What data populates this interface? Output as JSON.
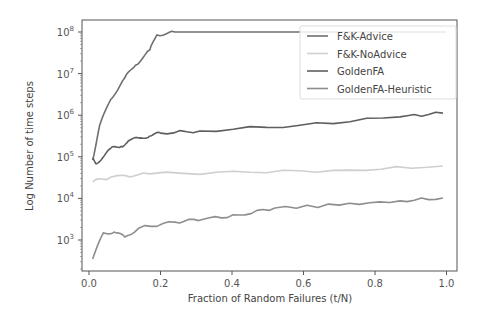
{
  "chart_data": {
    "type": "line",
    "title": "",
    "xlabel": "Fraction of Random Failures (t/N)",
    "ylabel": "Log Number of time steps",
    "xlim": [
      -0.01,
      1.03
    ],
    "ylim_log10": [
      2.3,
      8.3
    ],
    "yscale": "log",
    "x_ticks": [
      0.0,
      0.2,
      0.4,
      0.6,
      0.8,
      1.0
    ],
    "x_tick_labels": [
      "0.0",
      "0.2",
      "0.4",
      "0.6",
      "0.8",
      "1.0"
    ],
    "y_ticks_log10": [
      3,
      4,
      5,
      6,
      7,
      8
    ],
    "y_tick_labels": [
      "10^3",
      "10^4",
      "10^5",
      "10^6",
      "10^7",
      "10^8"
    ],
    "grid": false,
    "legend_position": "upper right",
    "series": [
      {
        "name": "F&K-Advice",
        "color": "#6f6f6f",
        "x": [
          0.01,
          0.03,
          0.06,
          0.1,
          0.13,
          0.17,
          0.19,
          0.24,
          0.4,
          0.6,
          0.8,
          1.0
        ],
        "log10_y": [
          4.92,
          5.76,
          6.37,
          6.9,
          7.2,
          7.57,
          7.93,
          8.0,
          8.0,
          8.0,
          8.0,
          8.0
        ]
      },
      {
        "name": "F&K-NoAdvice",
        "color": "#cfcfcf",
        "x": [
          0.01,
          0.06,
          0.17,
          0.45,
          0.73,
          0.99
        ],
        "log10_y": [
          4.4,
          4.51,
          4.59,
          4.63,
          4.68,
          4.78
        ]
      },
      {
        "name": "GoldenFA",
        "color": "#5e5e5e",
        "x": [
          0.01,
          0.02,
          0.06,
          0.09,
          0.11,
          0.14,
          0.17,
          0.2,
          0.31,
          0.59,
          0.87,
          0.99
        ],
        "log10_y": [
          4.97,
          4.83,
          5.2,
          5.25,
          5.38,
          5.45,
          5.5,
          5.57,
          5.62,
          5.76,
          5.96,
          6.05
        ]
      },
      {
        "name": "GoldenFA-Heuristic",
        "color": "#8e8e8e",
        "x": [
          0.01,
          0.04,
          0.07,
          0.1,
          0.14,
          0.24,
          0.32,
          0.42,
          0.52,
          0.7,
          0.87,
          0.99
        ],
        "log10_y": [
          2.54,
          3.17,
          3.19,
          3.07,
          3.29,
          3.43,
          3.5,
          3.6,
          3.77,
          3.84,
          3.94,
          4.01
        ]
      }
    ]
  },
  "legend": {
    "items": [
      {
        "label": "F&K-Advice"
      },
      {
        "label": "F&K-NoAdvice"
      },
      {
        "label": "GoldenFA"
      },
      {
        "label": "GoldenFA-Heuristic"
      }
    ]
  }
}
